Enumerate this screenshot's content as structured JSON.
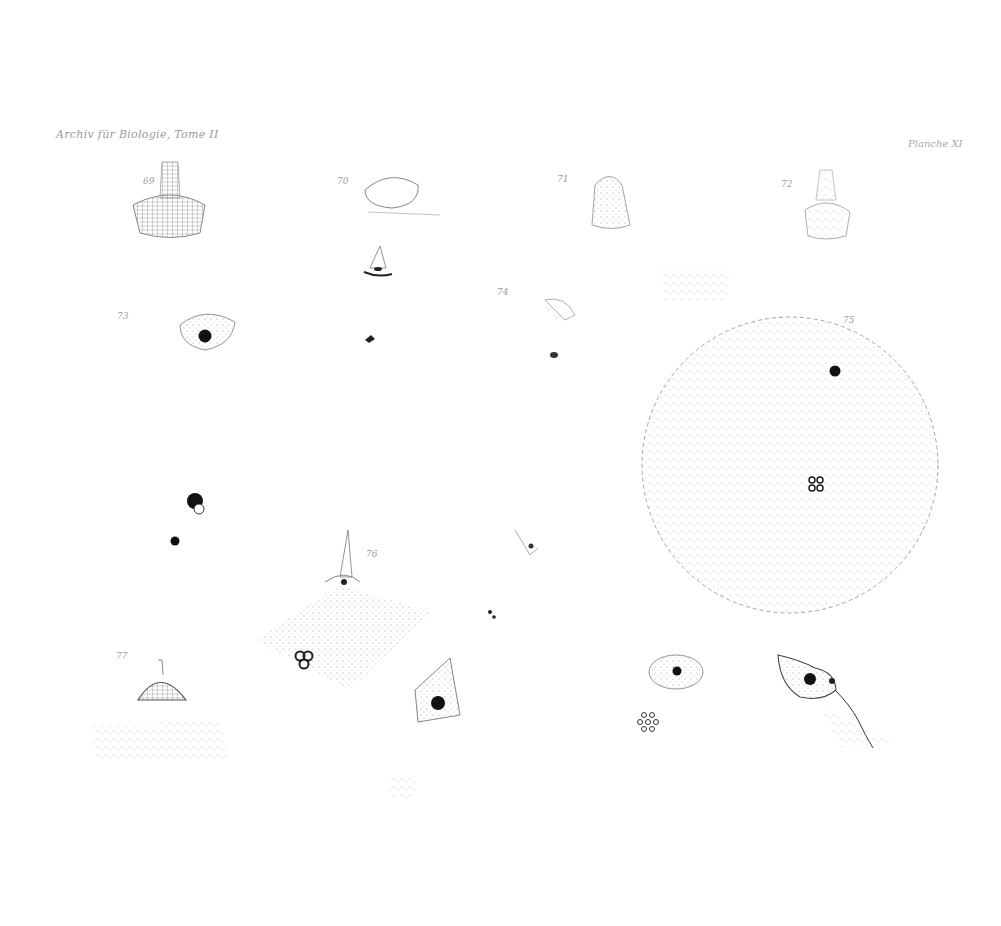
{
  "plate": {
    "header_left": "Archiv für Biologie, Tome II",
    "header_right": "Planche XI",
    "ink_color": "#1a1a1a",
    "stipple_color": "#8a8a8a",
    "background": "#ffffff"
  },
  "figures": [
    {
      "label": "69",
      "x": 143,
      "y": 176
    },
    {
      "label": "70",
      "x": 337,
      "y": 176
    },
    {
      "label": "71",
      "x": 557,
      "y": 174
    },
    {
      "label": "72",
      "x": 781,
      "y": 179
    },
    {
      "label": "73",
      "x": 117,
      "y": 311
    },
    {
      "label": "74",
      "x": 497,
      "y": 287
    },
    {
      "label": "75",
      "x": 843,
      "y": 315
    },
    {
      "label": "76",
      "x": 366,
      "y": 549
    },
    {
      "label": "77",
      "x": 116,
      "y": 651
    }
  ]
}
